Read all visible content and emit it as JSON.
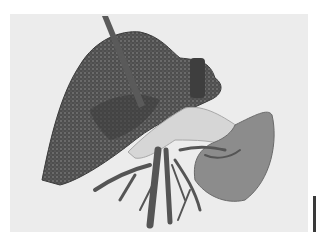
{
  "image": {
    "description": "Grayscale 3D volume rendering of abdominal organs: liver with vasculature, pancreas, spleen and branching vessels",
    "colors": {
      "background": "#ffffff",
      "panel": "#ececec",
      "liver": "#4a4a4a",
      "liver_speckle": "#8a8a8a",
      "pancreas": "#d6d6d6",
      "spleen": "#8c8c8c",
      "vessels": "#555555",
      "scalebar": "#3a3a3a"
    }
  }
}
